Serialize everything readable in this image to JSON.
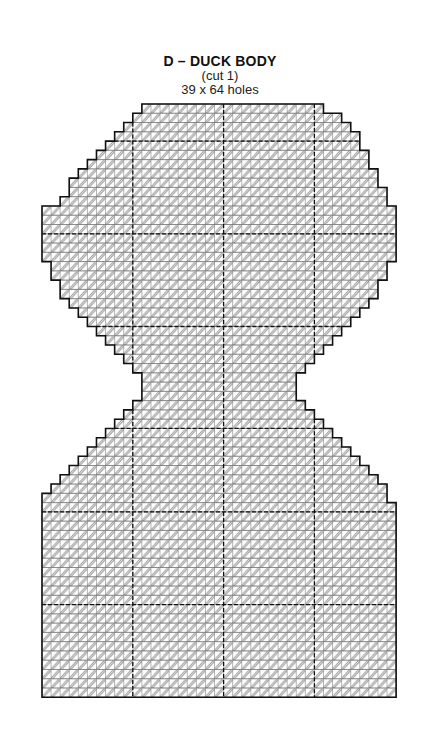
{
  "header": {
    "title": "D – DUCK BODY",
    "cut": "(cut 1)",
    "size": "39 x 64 holes"
  },
  "grid": {
    "columns": 39,
    "rows": 64,
    "origin_x": 42,
    "origin_y": 104,
    "cell_w": 9.08,
    "cell_h": 9.27,
    "divider_cols": [
      10,
      20,
      30
    ],
    "divider_rows": [
      4,
      14,
      24,
      35,
      44,
      54
    ],
    "stitch_color": "#9a9a9a",
    "outline_color": "#111111",
    "grid_color": "#666666",
    "row_ranges": [
      [
        11,
        31
      ],
      [
        10,
        33
      ],
      [
        9,
        34
      ],
      [
        8,
        35
      ],
      [
        7,
        35
      ],
      [
        6,
        36
      ],
      [
        5,
        36
      ],
      [
        4,
        37
      ],
      [
        3,
        37
      ],
      [
        3,
        38
      ],
      [
        2,
        38
      ],
      [
        0,
        39
      ],
      [
        0,
        39
      ],
      [
        0,
        39
      ],
      [
        0,
        39
      ],
      [
        0,
        39
      ],
      [
        0,
        39
      ],
      [
        1,
        38
      ],
      [
        1,
        38
      ],
      [
        2,
        37
      ],
      [
        2,
        37
      ],
      [
        3,
        36
      ],
      [
        4,
        35
      ],
      [
        5,
        34
      ],
      [
        6,
        33
      ],
      [
        7,
        32
      ],
      [
        8,
        31
      ],
      [
        9,
        30
      ],
      [
        10,
        29
      ],
      [
        11,
        28
      ],
      [
        11,
        28
      ],
      [
        11,
        28
      ],
      [
        10,
        29
      ],
      [
        9,
        30
      ],
      [
        8,
        31
      ],
      [
        7,
        32
      ],
      [
        6,
        33
      ],
      [
        5,
        34
      ],
      [
        4,
        35
      ],
      [
        3,
        36
      ],
      [
        2,
        37
      ],
      [
        1,
        38
      ],
      [
        0,
        38
      ],
      [
        0,
        39
      ],
      [
        0,
        39
      ],
      [
        0,
        39
      ],
      [
        0,
        39
      ],
      [
        0,
        39
      ],
      [
        0,
        39
      ],
      [
        0,
        39
      ],
      [
        0,
        39
      ],
      [
        0,
        39
      ],
      [
        0,
        39
      ],
      [
        0,
        39
      ],
      [
        0,
        39
      ],
      [
        0,
        39
      ],
      [
        0,
        39
      ],
      [
        0,
        39
      ],
      [
        0,
        39
      ],
      [
        0,
        39
      ],
      [
        0,
        39
      ],
      [
        0,
        39
      ],
      [
        0,
        39
      ],
      [
        0,
        39
      ]
    ]
  }
}
